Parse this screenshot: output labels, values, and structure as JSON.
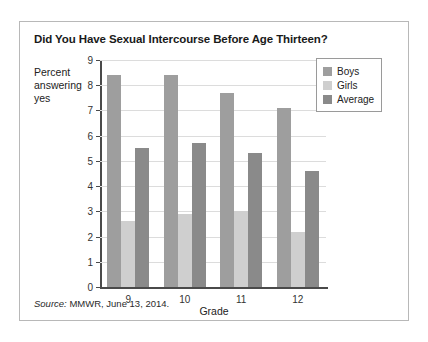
{
  "figure": {
    "title": "Did You Have Sexual Intercourse Before Age Thirteen?",
    "source_prefix": "Source:",
    "source_text": " MMWR, June 13, 2014."
  },
  "chart_data": {
    "type": "bar",
    "title": "Did You Have Sexual Intercourse Before Age Thirteen?",
    "xlabel": "Grade",
    "ylabel": "Percent answering yes",
    "categories": [
      "9",
      "10",
      "11",
      "12"
    ],
    "ylim": [
      0,
      9
    ],
    "yticks": [
      "0",
      "1",
      "2",
      "3",
      "4",
      "5",
      "6",
      "7",
      "8",
      "9"
    ],
    "grid": true,
    "legend_position": "top-right",
    "series": [
      {
        "name": "Boys",
        "color": "#9e9e9e",
        "values": [
          8.4,
          8.4,
          7.7,
          7.1
        ]
      },
      {
        "name": "Girls",
        "color": "#cfcfcf",
        "values": [
          2.6,
          2.9,
          3.0,
          2.2
        ]
      },
      {
        "name": "Average",
        "color": "#8a8a8a",
        "values": [
          5.5,
          5.7,
          5.3,
          4.6
        ]
      }
    ]
  }
}
